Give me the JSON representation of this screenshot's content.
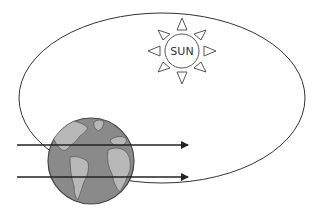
{
  "diagram": {
    "sun": {
      "label": "SUN",
      "cx": 182,
      "cy": 51,
      "r": 17
    },
    "orbit": {
      "cx": 162,
      "cy": 98,
      "rx": 143,
      "ry": 85
    },
    "earth": {
      "cx": 91,
      "cy": 161,
      "r": 43
    },
    "arrows": [
      {
        "y": 145,
        "x1": 17,
        "x2": 188
      },
      {
        "y": 177,
        "x1": 17,
        "x2": 188
      }
    ],
    "colors": {
      "line": "#333333",
      "earth_ocean": "#8a8a8a",
      "earth_land": "#b5b5b5",
      "arrow": "#222222"
    }
  }
}
